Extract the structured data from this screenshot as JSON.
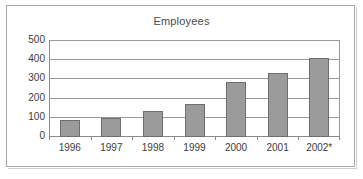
{
  "chart_data": {
    "type": "bar",
    "title": "Employees",
    "xlabel": "",
    "ylabel": "",
    "categories": [
      "1996",
      "1997",
      "1998",
      "1999",
      "2000",
      "2001",
      "2002*"
    ],
    "values": [
      85,
      95,
      130,
      165,
      280,
      330,
      405
    ],
    "ylim": [
      0,
      500
    ],
    "yticks": [
      "0",
      "100",
      "200",
      "300",
      "400",
      "500"
    ],
    "ytick_values": [
      0,
      100,
      200,
      300,
      400,
      500
    ],
    "grid": "horizontal",
    "legend": "none",
    "series_color": "#9b9b9b",
    "series_border_color": "#6e6e6e",
    "gridline_color": "#9a9a9a",
    "axis_color": "#8a8a8a",
    "frame_color": "#a8a8a8",
    "text_color": "#3c3c3c",
    "title_color": "#4a4a4a",
    "background": "#ffffff"
  }
}
